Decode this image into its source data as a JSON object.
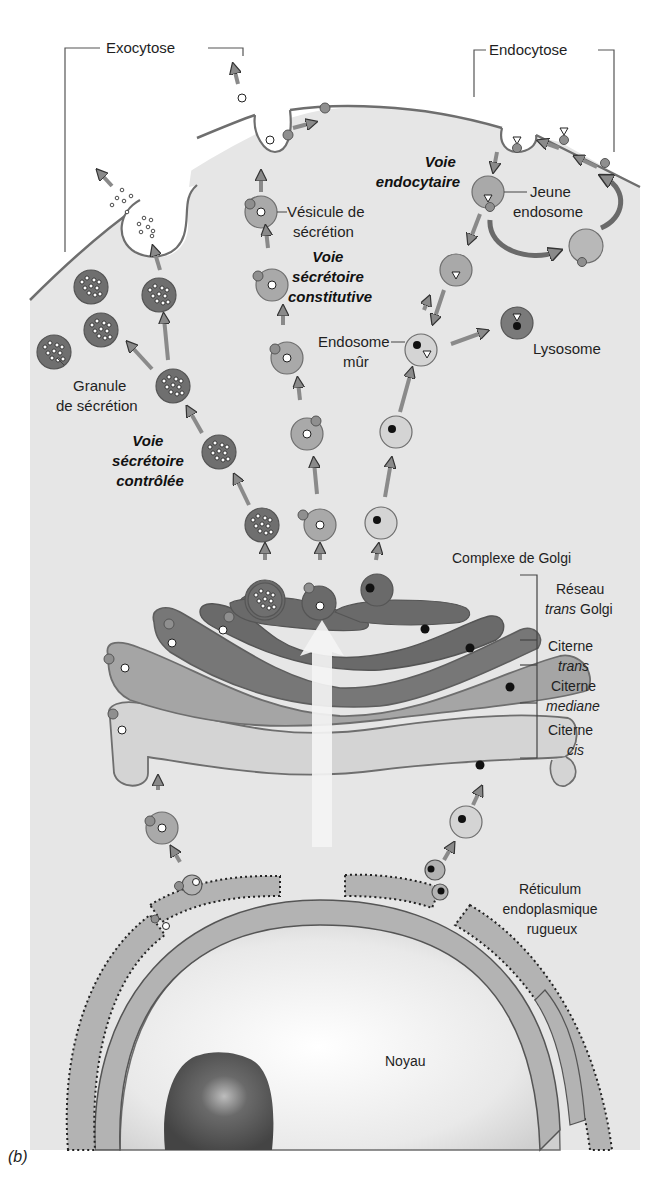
{
  "figure": {
    "panel_label": "(b)",
    "colors": {
      "background": "#ffffff",
      "cytoplasm": "#e6e6e6",
      "membrane": "#6e6e6e",
      "granule_dark": "#6f6f6f",
      "vesicle_mid": "#a9a9a9",
      "vesicle_light": "#cfcfcf",
      "golgi_trans_network": "#6a6a6a",
      "golgi_trans": "#777777",
      "golgi_median": "#a5a5a5",
      "golgi_cis": "#d4d4d4",
      "er": "#b3b3b3",
      "nucleolus": "#555555",
      "arrow": "#8a8a8a",
      "white_arrow": "#f4f4f4"
    }
  },
  "labels": {
    "exocytose": "Exocytose",
    "endocytose": "Endocytose",
    "voie_endocytaire": [
      "Voie",
      "endocytaire"
    ],
    "jeune_endosome": [
      "Jeune",
      "endosome"
    ],
    "vesicule_secretion": [
      "Vésicule de",
      "sécrétion"
    ],
    "voie_secretoire_constitutive": [
      "Voie",
      "sécrétoire",
      "constitutive"
    ],
    "granule_secretion": [
      "Granule",
      "de sécrétion"
    ],
    "endosome_mur": [
      "Endosome",
      "mûr"
    ],
    "lysosome": "Lysosome",
    "voie_secretoire_controlee": [
      "Voie",
      "sécrétoire",
      "contrôlée"
    ],
    "complexe_golgi": "Complexe de Golgi",
    "reseau_trans_golgi": [
      "Réseau",
      "trans",
      " Golgi"
    ],
    "citerne_trans": [
      "Citerne",
      "trans"
    ],
    "citerne_mediane": [
      "Citerne",
      "mediane"
    ],
    "citerne_cis": [
      "Citerne",
      "cis"
    ],
    "reticulum": [
      "Réticulum",
      "endoplasmique",
      "rugueux"
    ],
    "noyau": "Noyau"
  }
}
